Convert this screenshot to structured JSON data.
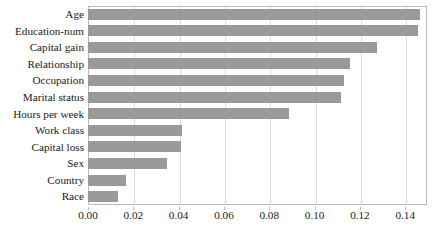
{
  "chart_data": {
    "type": "bar",
    "orientation": "horizontal",
    "title": "",
    "subtitle": "",
    "xlabel": "",
    "ylabel": "",
    "xlim": [
      0.0,
      0.1496
    ],
    "xtick_labels": [
      "0.00",
      "0.02",
      "0.04",
      "0.06",
      "0.08",
      "0.10",
      "0.12",
      "0.14"
    ],
    "xtick_values": [
      0.0,
      0.02,
      0.04,
      0.06,
      0.08,
      0.1,
      0.12,
      0.14
    ],
    "grid": "vertical",
    "legend": "none",
    "bar_color": "#9a9a9a",
    "gridline_color": "#d9d9d9",
    "axis_border_color": "#b9b9b9",
    "categories": [
      "Age",
      "Education-num",
      "Capital gain",
      "Relationship",
      "Occupation",
      "Marital status",
      "Hours per week",
      "Work class",
      "Capital loss",
      "Sex",
      "Country",
      "Race"
    ],
    "values": [
      0.1466,
      0.1457,
      0.1276,
      0.1157,
      0.113,
      0.1117,
      0.0887,
      0.0414,
      0.0411,
      0.0347,
      0.0166,
      0.0134
    ]
  }
}
